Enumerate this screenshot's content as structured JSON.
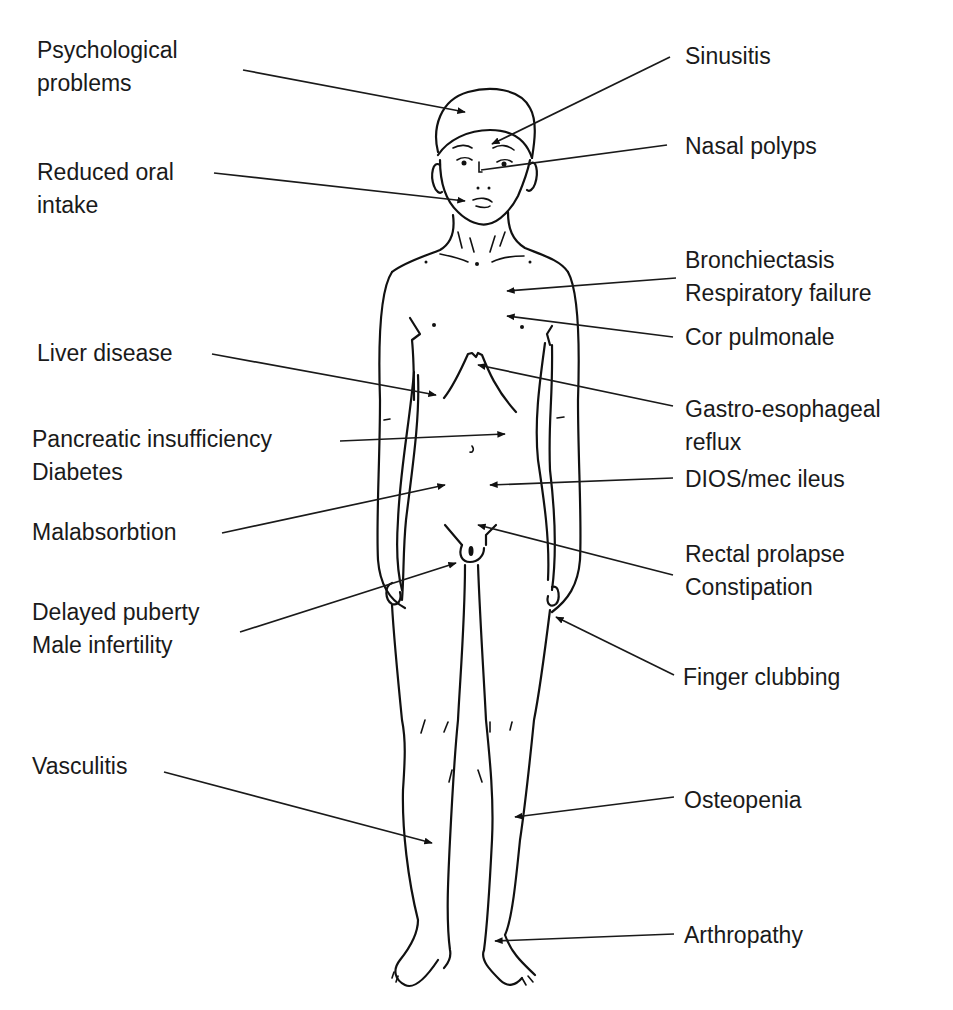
{
  "diagram": {
    "labels_left": [
      {
        "id": "psychological",
        "lines": [
          "Psychological",
          "problems"
        ]
      },
      {
        "id": "oral-intake",
        "lines": [
          "Reduced oral",
          "intake"
        ]
      },
      {
        "id": "liver",
        "lines": [
          "Liver disease"
        ]
      },
      {
        "id": "pancreatic",
        "lines": [
          "Pancreatic insufficiency",
          "Diabetes"
        ]
      },
      {
        "id": "malabsorption",
        "lines": [
          "Malabsorbtion"
        ]
      },
      {
        "id": "puberty",
        "lines": [
          "Delayed puberty",
          "Male infertility"
        ]
      },
      {
        "id": "vasculitis",
        "lines": [
          "Vasculitis"
        ]
      }
    ],
    "labels_right": [
      {
        "id": "sinusitis",
        "lines": [
          "Sinusitis"
        ]
      },
      {
        "id": "nasal-polyps",
        "lines": [
          "Nasal polyps"
        ]
      },
      {
        "id": "bronchiectasis",
        "lines": [
          "Bronchiectasis",
          "Respiratory failure"
        ]
      },
      {
        "id": "cor-pulmonale",
        "lines": [
          "Cor pulmonale"
        ]
      },
      {
        "id": "reflux",
        "lines": [
          "Gastro-esophageal",
          "reflux"
        ]
      },
      {
        "id": "dios",
        "lines": [
          "DIOS/mec ileus"
        ]
      },
      {
        "id": "rectal",
        "lines": [
          "Rectal prolapse",
          "Constipation"
        ]
      },
      {
        "id": "clubbing",
        "lines": [
          "Finger clubbing"
        ]
      },
      {
        "id": "osteopenia",
        "lines": [
          "Osteopenia"
        ]
      },
      {
        "id": "arthropathy",
        "lines": [
          "Arthropathy"
        ]
      }
    ],
    "colors": {
      "line": "#111111",
      "text": "#1a1a1a",
      "background": "#ffffff"
    }
  }
}
